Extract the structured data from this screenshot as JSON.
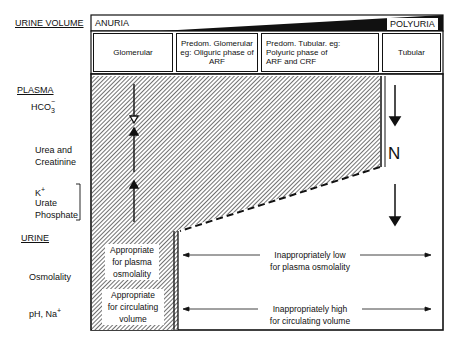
{
  "axis": {
    "label": "URINE VOLUME",
    "left_end": "ANURIA",
    "right_end": "POLYURIA"
  },
  "columns": [
    {
      "label": "Glomerular"
    },
    {
      "label": "Predom. Glomerular eg: Oliguric phase of ARF",
      "line1": "Predom. Glomerular",
      "line2": "eg: Oliguric phase of",
      "line3": "ARF"
    },
    {
      "label": "Predom. Tubular. eg: Polyuric phase of ARF and CRF",
      "line1": "Predom. Tubular. eg:",
      "line2": "Polyuric phase of",
      "line3": "ARF and CRF"
    },
    {
      "label": "Tubular"
    }
  ],
  "rows": {
    "plasma": {
      "heading": "PLASMA",
      "hco3": "HCO",
      "hco3_sub": "3",
      "hco3_sup": "−",
      "urea_line1": "Urea and",
      "urea_line2": "Creatinine",
      "k": "K",
      "k_sup": "+",
      "urate": "Urate",
      "phosphate": "Phosphate"
    },
    "urine": {
      "heading": "URINE",
      "osmolality": "Osmolality",
      "ph_na": "pH, Na",
      "ph_na_sup": "+"
    }
  },
  "glomerular_notes": {
    "osmo_line1": "Appropriate",
    "osmo_line2": "for plasma",
    "osmo_line3": "osmolality",
    "vol_line1": "Appropriate",
    "vol_line2": "for circulating",
    "vol_line3": "volume"
  },
  "tubular_notes": {
    "osmo_line1": "Inappropriately low",
    "osmo_line2": "for plasma osmolality",
    "vol_line1": "Inappropriately high",
    "vol_line2": "for circulating volume"
  },
  "tubular_plasma_label": "N",
  "arrows": {
    "hco3": "down",
    "urea_creatinine": "up",
    "k_urate_phosphate": "up",
    "tubular_hco3": "down",
    "tubular_k_urate_phosphate": "down"
  },
  "colors": {
    "ink": "#111111",
    "paper": "#ffffff",
    "hatch": "#555555"
  }
}
